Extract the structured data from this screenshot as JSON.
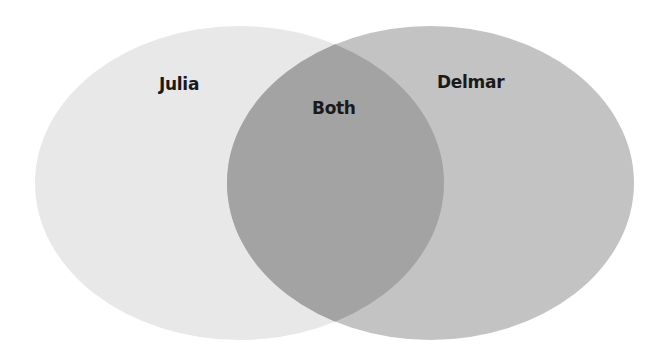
{
  "diagram": {
    "type": "venn",
    "sets": [
      {
        "id": "left",
        "label": "Julia",
        "fill": "#e8e8e8"
      },
      {
        "id": "right",
        "label": "Delmar",
        "fill": "#c3c3c3"
      }
    ],
    "intersection": {
      "label": "Both",
      "fill": "#a3a3a3"
    }
  },
  "labels": {
    "left": "Julia",
    "right": "Delmar",
    "overlap": "Both"
  }
}
